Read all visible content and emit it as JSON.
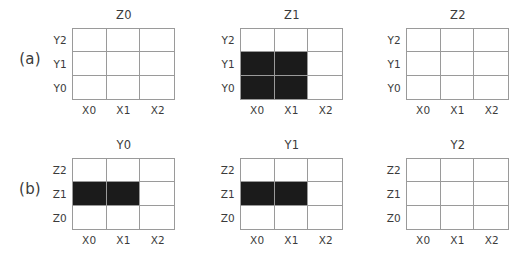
{
  "figure": {
    "rows": [
      {
        "label": "(a)",
        "ylabels": [
          "Y2",
          "Y1",
          "Y0"
        ],
        "xlabels": [
          "X0",
          "X1",
          "X2"
        ],
        "panels": [
          {
            "title": "Z0",
            "filled": [
              [
                false,
                false,
                false
              ],
              [
                false,
                false,
                false
              ],
              [
                false,
                false,
                false
              ]
            ]
          },
          {
            "title": "Z1",
            "filled": [
              [
                false,
                false,
                false
              ],
              [
                true,
                true,
                false
              ],
              [
                true,
                true,
                false
              ]
            ]
          },
          {
            "title": "Z2",
            "filled": [
              [
                false,
                false,
                false
              ],
              [
                false,
                false,
                false
              ],
              [
                false,
                false,
                false
              ]
            ]
          }
        ]
      },
      {
        "label": "(b)",
        "ylabels": [
          "Z2",
          "Z1",
          "Z0"
        ],
        "xlabels": [
          "X0",
          "X1",
          "X2"
        ],
        "panels": [
          {
            "title": "Y0",
            "filled": [
              [
                false,
                false,
                false
              ],
              [
                true,
                true,
                false
              ],
              [
                false,
                false,
                false
              ]
            ]
          },
          {
            "title": "Y1",
            "filled": [
              [
                false,
                false,
                false
              ],
              [
                true,
                true,
                false
              ],
              [
                false,
                false,
                false
              ]
            ]
          },
          {
            "title": "Y2",
            "filled": [
              [
                false,
                false,
                false
              ],
              [
                false,
                false,
                false
              ],
              [
                false,
                false,
                false
              ]
            ]
          }
        ]
      }
    ]
  },
  "chart_data": {
    "type": "heatmap",
    "title": "",
    "colors": {
      "filled": "#1b1b1b",
      "empty": "#ffffff",
      "gridline": "#9a9a9a",
      "text": "#3b3b3b"
    },
    "grid": true,
    "legend": "none",
    "panels": [
      {
        "row": "(a)",
        "title": "Z0",
        "xlabel": "",
        "ylabel": "",
        "x": [
          "X0",
          "X1",
          "X2"
        ],
        "y": [
          "Y0",
          "Y1",
          "Y2"
        ],
        "values": [
          [
            0,
            0,
            0
          ],
          [
            0,
            0,
            0
          ],
          [
            0,
            0,
            0
          ]
        ],
        "filled_cells": []
      },
      {
        "row": "(a)",
        "title": "Z1",
        "xlabel": "",
        "ylabel": "",
        "x": [
          "X0",
          "X1",
          "X2"
        ],
        "y": [
          "Y0",
          "Y1",
          "Y2"
        ],
        "values": [
          [
            1,
            1,
            0
          ],
          [
            1,
            1,
            0
          ],
          [
            0,
            0,
            0
          ]
        ],
        "filled_cells": [
          [
            "X0",
            "Y0"
          ],
          [
            "X1",
            "Y0"
          ],
          [
            "X0",
            "Y1"
          ],
          [
            "X1",
            "Y1"
          ]
        ]
      },
      {
        "row": "(a)",
        "title": "Z2",
        "xlabel": "",
        "ylabel": "",
        "x": [
          "X0",
          "X1",
          "X2"
        ],
        "y": [
          "Y0",
          "Y1",
          "Y2"
        ],
        "values": [
          [
            0,
            0,
            0
          ],
          [
            0,
            0,
            0
          ],
          [
            0,
            0,
            0
          ]
        ],
        "filled_cells": []
      },
      {
        "row": "(b)",
        "title": "Y0",
        "xlabel": "",
        "ylabel": "",
        "x": [
          "X0",
          "X1",
          "X2"
        ],
        "y": [
          "Z0",
          "Z1",
          "Z2"
        ],
        "values": [
          [
            0,
            0,
            0
          ],
          [
            1,
            1,
            0
          ],
          [
            0,
            0,
            0
          ]
        ],
        "filled_cells": [
          [
            "X0",
            "Z1"
          ],
          [
            "X1",
            "Z1"
          ]
        ]
      },
      {
        "row": "(b)",
        "title": "Y1",
        "xlabel": "",
        "ylabel": "",
        "x": [
          "X0",
          "X1",
          "X2"
        ],
        "y": [
          "Z0",
          "Z1",
          "Z2"
        ],
        "values": [
          [
            0,
            0,
            0
          ],
          [
            1,
            1,
            0
          ],
          [
            0,
            0,
            0
          ]
        ],
        "filled_cells": [
          [
            "X0",
            "Z1"
          ],
          [
            "X1",
            "Z1"
          ]
        ]
      },
      {
        "row": "(b)",
        "title": "Y2",
        "xlabel": "",
        "ylabel": "",
        "x": [
          "X0",
          "X1",
          "X2"
        ],
        "y": [
          "Z0",
          "Z1",
          "Z2"
        ],
        "values": [
          [
            0,
            0,
            0
          ],
          [
            0,
            0,
            0
          ],
          [
            0,
            0,
            0
          ]
        ],
        "filled_cells": []
      }
    ]
  }
}
